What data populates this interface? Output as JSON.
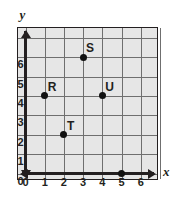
{
  "figure": {
    "type": "coordinate-grid",
    "background_color": "#ffffff",
    "plot_fill_color": "#e6e6e6",
    "grid_color": "#6f6f6f",
    "axis_color": "#231f20",
    "point_color": "#111111"
  },
  "axes": {
    "x_name": "x",
    "y_name": "y",
    "x_range": [
      0,
      7
    ],
    "y_range": [
      0,
      7
    ],
    "x_ticks": [
      "0",
      "1",
      "2",
      "3",
      "4",
      "5",
      "6"
    ],
    "y_ticks": [
      "0",
      "1",
      "2",
      "3",
      "4",
      "5",
      "6"
    ],
    "grid": true,
    "x_arrow_left": "arrow-left",
    "x_arrow_right": "arrow-right",
    "y_arrow_up": "arrow-up",
    "y_arrow_down": "arrow-down"
  },
  "chart_data": {
    "type": "scatter",
    "title": "",
    "xlabel": "x",
    "ylabel": "y",
    "xlim": [
      0,
      7
    ],
    "ylim": [
      0,
      7
    ],
    "grid": true,
    "legend": "none",
    "points": [
      {
        "label": "R",
        "x": 1,
        "y": 4,
        "label_position": "above-right"
      },
      {
        "label": "S",
        "x": 3,
        "y": 6,
        "label_position": "above-right"
      },
      {
        "label": "T",
        "x": 2,
        "y": 2,
        "label_position": "above-right"
      },
      {
        "label": "U",
        "x": 4,
        "y": 4,
        "label_position": "above-right"
      },
      {
        "label": "",
        "x": 5,
        "y": 0,
        "label_position": "none"
      }
    ]
  }
}
